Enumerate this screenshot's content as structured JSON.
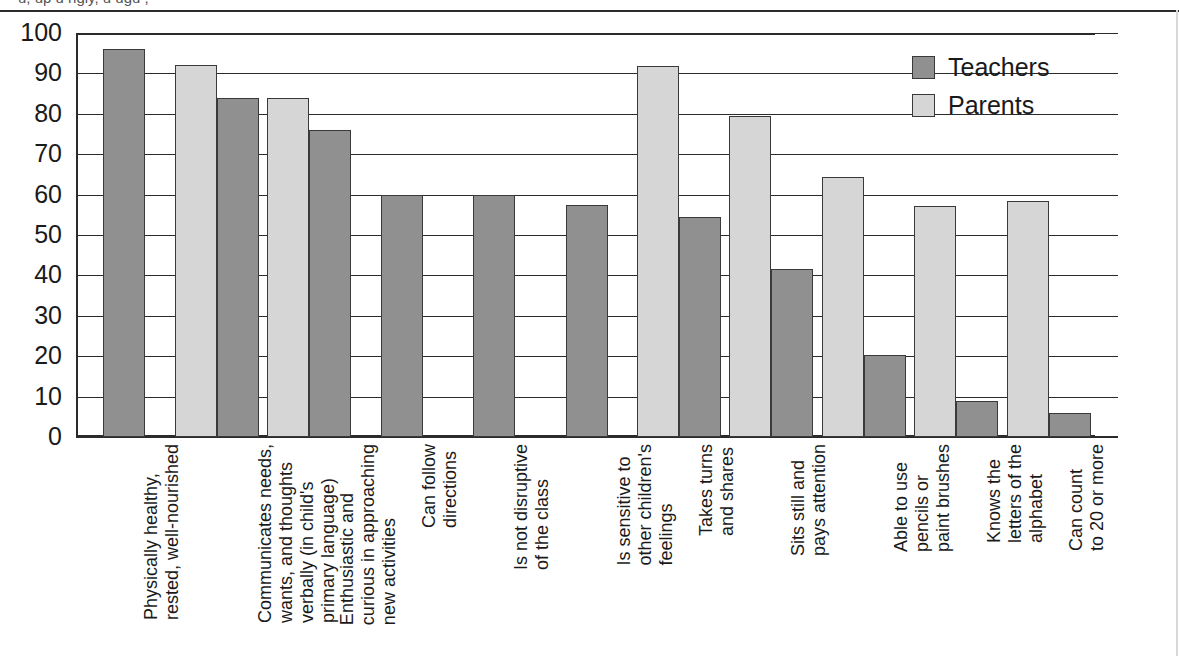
{
  "caption": {
    "clipped_top_line": "u, up   u   ngly,   u   ugu   ,"
  },
  "legend": {
    "position": "top-right",
    "entries": [
      {
        "label": "Teachers",
        "color": "#909090",
        "icon": "square-swatch"
      },
      {
        "label": "Parents",
        "color": "#d6d6d6",
        "icon": "square-swatch"
      }
    ]
  },
  "axis": {
    "y_ticks": [
      "100",
      "90",
      "80",
      "70",
      "60",
      "50",
      "40",
      "30",
      "20",
      "10",
      "0"
    ]
  },
  "chart_data": {
    "type": "bar",
    "title": "",
    "xlabel": "",
    "ylabel": "",
    "ylim": [
      0,
      100
    ],
    "ytick_step": 10,
    "grid": true,
    "legend_position": "top-right",
    "categories": [
      "Physically healthy,\nrested, well-nourished",
      "Communicates needs,\nwants, and thoughts\nverbally (in child's\nprimary language)",
      "Enthusiastic and\ncurious in approaching\nnew activities",
      "Can follow\ndirections",
      "Is not disruptive\nof the class",
      "Is sensitive to\nother children's\nfeelings",
      "Takes turns\nand shares",
      "Sits still and\npays attention",
      "Able to use\npencils or\npaint brushes",
      "Knows the\nletters of the\nalphabet",
      "Can count\nto 20 or more"
    ],
    "category_lines": [
      [
        "Physically healthy,",
        "rested, well-nourished"
      ],
      [
        "Communicates needs,",
        "wants, and thoughts",
        "verbally (in child's",
        "primary language)"
      ],
      [
        "Enthusiastic and",
        "curious in approaching",
        "new activities"
      ],
      [
        "Can follow",
        "directions"
      ],
      [
        "Is not disruptive",
        "of the class"
      ],
      [
        "Is sensitive to",
        "other children's",
        "feelings"
      ],
      [
        "Takes turns",
        "and shares"
      ],
      [
        "Sits still and",
        "pays attention"
      ],
      [
        "Able to use",
        "pencils or",
        "paint brushes"
      ],
      [
        "Knows the",
        "letters of the",
        "alphabet"
      ],
      [
        "Can count",
        "to 20 or more"
      ]
    ],
    "series": [
      {
        "name": "Teachers",
        "color": "#909090",
        "values": [
          96,
          84,
          76,
          60,
          60,
          57.5,
          54.5,
          41.5,
          20.3,
          9,
          6
        ]
      },
      {
        "name": "Parents",
        "color": "#d6d6d6",
        "values": [
          null,
          92,
          84,
          null,
          null,
          null,
          91.8,
          79.5,
          64.3,
          57.3,
          58.5
        ]
      }
    ],
    "bars_in_draw_order": [
      {
        "group": 0,
        "series": "Teachers",
        "value": 96
      },
      {
        "group": 1,
        "series": "Parents",
        "value": 92
      },
      {
        "group": 1,
        "series": "Teachers",
        "value": 84
      },
      {
        "group": 2,
        "series": "Parents",
        "value": 84
      },
      {
        "group": 2,
        "series": "Teachers",
        "value": 76
      },
      {
        "group": 3,
        "series": "Teachers",
        "value": 60
      },
      {
        "group": 4,
        "series": "Teachers",
        "value": 60
      },
      {
        "group": 5,
        "series": "Teachers",
        "value": 57.5
      },
      {
        "group": 6,
        "series": "Parents",
        "value": 91.8
      },
      {
        "group": 6,
        "series": "Teachers",
        "value": 54.5
      },
      {
        "group": 7,
        "series": "Parents",
        "value": 79.5
      },
      {
        "group": 7,
        "series": "Teachers",
        "value": 41.5
      },
      {
        "group": 8,
        "series": "Parents",
        "value": 64.3
      },
      {
        "group": 8,
        "series": "Teachers",
        "value": 20.3
      },
      {
        "group": 9,
        "series": "Parents",
        "value": 57.3
      },
      {
        "group": 9,
        "series": "Teachers",
        "value": 9
      },
      {
        "group": 10,
        "series": "Parents",
        "value": 58.5
      },
      {
        "group": 10,
        "series": "Teachers",
        "value": 6
      }
    ]
  }
}
